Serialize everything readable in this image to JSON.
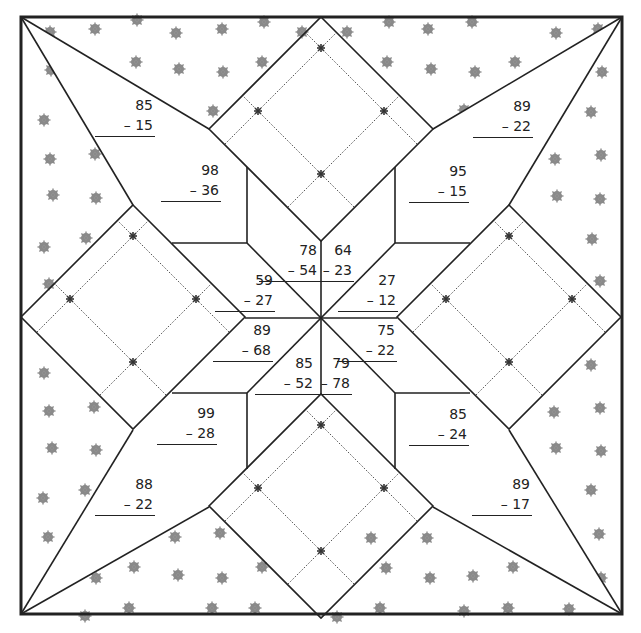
{
  "worksheet": {
    "title": "Subtraction quilt",
    "colors": {
      "line": "#222222",
      "dot": "#8a8a8a",
      "background": "#ffffff"
    },
    "problems": [
      {
        "id": "kite-top-left",
        "minuend": "85",
        "subtrahend": "– 15",
        "x": 122,
        "y": 151
      },
      {
        "id": "pentagon-top-left",
        "minuend": "98",
        "subtrahend": "– 36",
        "x": 158,
        "y": 160
      },
      {
        "id": "kite-top-right",
        "minuend": "89",
        "subtrahend": "– 22",
        "x": 457,
        "y": 151
      },
      {
        "id": "pentagon-top-right",
        "minuend": "95",
        "subtrahend": "– 15",
        "x": 392,
        "y": 160
      },
      {
        "id": "star-top-left-upper",
        "minuend": "78",
        "subtrahend": "– 54",
        "x": 258,
        "y": 241
      },
      {
        "id": "star-top-right-upper",
        "minuend": "64",
        "subtrahend": "– 23",
        "x": 293,
        "y": 241
      },
      {
        "id": "star-top-left-lower",
        "minuend": "59",
        "subtrahend": "– 27",
        "x": 214,
        "y": 270
      },
      {
        "id": "star-top-right-lower",
        "minuend": "27",
        "subtrahend": "– 12",
        "x": 339,
        "y": 270
      },
      {
        "id": "star-bottom-left-upper",
        "minuend": "89",
        "subtrahend": "– 68",
        "x": 212,
        "y": 320
      },
      {
        "id": "star-bottom-right-upper",
        "minuend": "75",
        "subtrahend": "– 22",
        "x": 339,
        "y": 320
      },
      {
        "id": "star-bottom-left-lower",
        "minuend": "85",
        "subtrahend": "– 52",
        "x": 253,
        "y": 354
      },
      {
        "id": "star-bottom-right-lower",
        "minuend": "79",
        "subtrahend": "– 78",
        "x": 293,
        "y": 354
      },
      {
        "id": "pentagon-bottom-left",
        "minuend": "99",
        "subtrahend": "– 28",
        "x": 155,
        "y": 403
      },
      {
        "id": "pentagon-bottom-right",
        "minuend": "85",
        "subtrahend": "– 24",
        "x": 392,
        "y": 403
      },
      {
        "id": "kite-bottom-left",
        "minuend": "88",
        "subtrahend": "– 22",
        "x": 122,
        "y": 472
      },
      {
        "id": "kite-bottom-right",
        "minuend": "89",
        "subtrahend": "– 17",
        "x": 457,
        "y": 472
      }
    ]
  }
}
